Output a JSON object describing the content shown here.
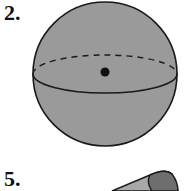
{
  "problems": [
    {
      "number": "2.",
      "figure": "sphere-with-center-point"
    },
    {
      "number": "5.",
      "figure": "cone"
    }
  ],
  "colors": {
    "fill": "#9a9a9a",
    "stroke": "#1a1a1a",
    "cone_dark": "#6e6e6e",
    "cone_light": "#a8a8a8"
  }
}
